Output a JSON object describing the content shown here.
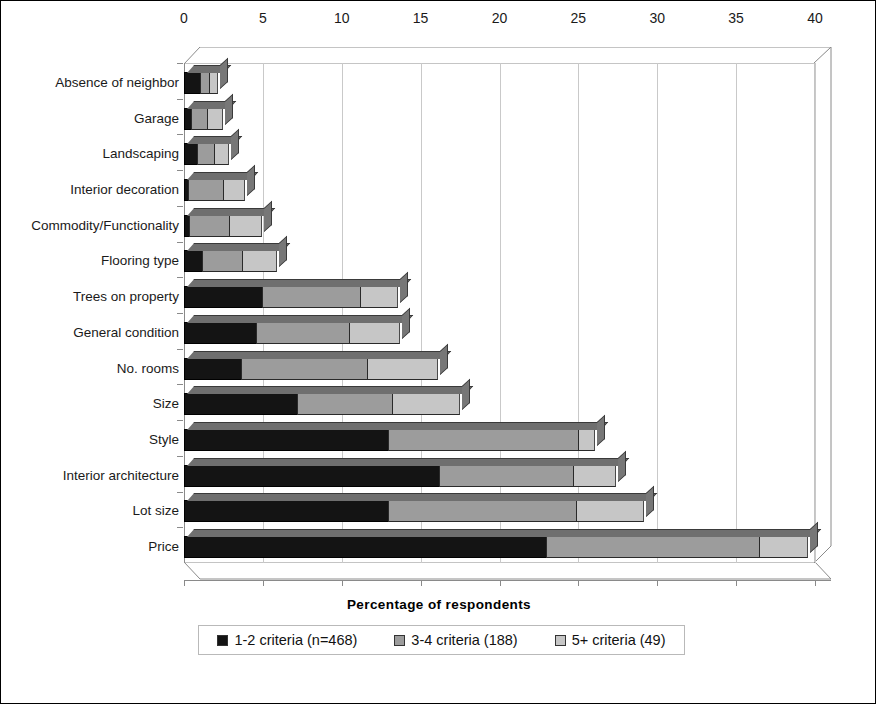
{
  "chart_data": {
    "type": "bar",
    "orientation": "horizontal",
    "stacked": true,
    "title": "",
    "xlabel": "Percentage of respondents",
    "ylabel": "",
    "xlim": [
      0,
      40
    ],
    "xticks": [
      0,
      5,
      10,
      15,
      20,
      25,
      30,
      35,
      40
    ],
    "grid": true,
    "legend_position": "bottom",
    "categories": [
      "Absence of neighbor",
      "Garage",
      "Landscaping",
      "Interior decoration",
      "Commodity/Functionality",
      "Flooring type",
      "Trees on property",
      "General condition",
      "No. rooms",
      "Size",
      "Style",
      "Interior architecture",
      "Lot size",
      "Price"
    ],
    "series": [
      {
        "name": "1-2 criteria (n=468)",
        "color": "#141414",
        "values": [
          1.1,
          0.5,
          0.9,
          0.3,
          0.4,
          1.2,
          5.0,
          4.6,
          3.7,
          7.2,
          13.0,
          16.2,
          13.0,
          23.0
        ]
      },
      {
        "name": "3-4 criteria (188)",
        "color": "#9c9c9c",
        "values": [
          0.6,
          1.1,
          1.1,
          2.3,
          2.6,
          2.6,
          6.3,
          6.0,
          8.0,
          6.1,
          12.1,
          8.6,
          12.0,
          13.6
        ]
      },
      {
        "name": "5+ criteria (49)",
        "color": "#c6c6c6",
        "values": [
          0.6,
          1.0,
          1.0,
          1.4,
          2.1,
          2.2,
          2.4,
          3.2,
          4.5,
          4.3,
          1.1,
          2.7,
          4.3,
          3.1
        ]
      }
    ],
    "totals": [
      2.3,
      2.6,
      3.0,
      4.0,
      5.1,
      6.0,
      13.7,
      13.8,
      16.2,
      17.6,
      26.2,
      27.5,
      29.3,
      39.7
    ]
  },
  "legend": {
    "items": [
      {
        "label": "1-2 criteria (n=468)",
        "swatch": "legend-swatch-black"
      },
      {
        "label": "3-4 criteria (188)",
        "swatch": "legend-swatch-gray"
      },
      {
        "label": "5+ criteria (49)",
        "swatch": "legend-swatch-lightgray"
      }
    ]
  },
  "colors": {
    "series_1": "#141414",
    "series_2": "#9c9c9c",
    "series_3": "#c6c6c6",
    "gridline": "#c9c9c9",
    "axis": "#8a8a8a",
    "background": "#ffffff"
  }
}
